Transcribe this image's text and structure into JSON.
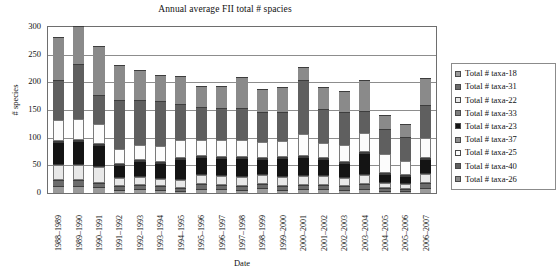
{
  "chart_data": {
    "type": "bar",
    "stacked": true,
    "title": "Annual average FII total # spacies",
    "xlabel": "Date",
    "ylabel": "# species",
    "ylim": [
      0,
      300
    ],
    "yticks": [
      0,
      50,
      100,
      150,
      200,
      250,
      300
    ],
    "grid": true,
    "legend_position": "right",
    "categories": [
      "1988–1989",
      "1989–1990",
      "1990–1991",
      "1991–1992",
      "1992–1993",
      "1993–1994",
      "1994–1995",
      "1995–1996",
      "1996–1997",
      "1997–1998",
      "1998–1999",
      "1999–2000",
      "2000–2001",
      "2001–2002",
      "2002–2003",
      "2003–2004",
      "2004–2005",
      "2005–2006",
      "2006–2007"
    ],
    "series": [
      {
        "name": "Total # taxa-18",
        "color": "#9a9a9a",
        "values": [
          12,
          12,
          10,
          6,
          7,
          6,
          4,
          8,
          7,
          6,
          9,
          6,
          7,
          7,
          6,
          8,
          4,
          4,
          9
        ]
      },
      {
        "name": "Total # taxa-31",
        "color": "#6b6b6b",
        "values": [
          11,
          11,
          8,
          6,
          7,
          6,
          5,
          8,
          7,
          6,
          8,
          7,
          8,
          7,
          7,
          9,
          5,
          4,
          9
        ]
      },
      {
        "name": "Total # taxa-22",
        "color": "#e8e8e8",
        "values": [
          28,
          28,
          29,
          15,
          15,
          14,
          15,
          16,
          16,
          17,
          15,
          16,
          16,
          16,
          15,
          16,
          9,
          8,
          17
        ]
      },
      {
        "name": "Total # taxa-33",
        "color": "#7d7d7d",
        "values": [
          1,
          1,
          1,
          1,
          1,
          1,
          1,
          1,
          1,
          1,
          1,
          1,
          1,
          1,
          1,
          1,
          1,
          1,
          1
        ]
      },
      {
        "name": "Total # taxa-23",
        "color": "#141414",
        "values": [
          40,
          42,
          38,
          22,
          28,
          27,
          36,
          32,
          32,
          33,
          28,
          32,
          33,
          30,
          25,
          37,
          14,
          13,
          25
        ]
      },
      {
        "name": "Total # taxa-37",
        "color": "#8f8f8f",
        "values": [
          1,
          1,
          1,
          1,
          1,
          1,
          1,
          1,
          1,
          1,
          1,
          1,
          1,
          1,
          1,
          1,
          1,
          1,
          1
        ]
      },
      {
        "name": "Total # taxa-25",
        "color": "#fcfcfc",
        "values": [
          38,
          37,
          37,
          27,
          27,
          28,
          32,
          29,
          30,
          31,
          29,
          29,
          39,
          27,
          31,
          34,
          35,
          25,
          36
        ]
      },
      {
        "name": "Total # taxa-40",
        "color": "#5f5f5f",
        "values": [
          72,
          99,
          52,
          88,
          81,
          81,
          65,
          59,
          58,
          57,
          54,
          53,
          98,
          62,
          59,
          41,
          46,
          43,
          60
        ]
      },
      {
        "name": "Total # taxa-26",
        "color": "#8a8a8a",
        "values": [
          78,
          69,
          88,
          64,
          53,
          48,
          51,
          38,
          40,
          56,
          41,
          45,
          23,
          39,
          38,
          55,
          25,
          25,
          49
        ]
      }
    ]
  },
  "legend": {
    "items": [
      {
        "label": "Total # taxa-18",
        "color": "#9a9a9a"
      },
      {
        "label": "Total # taxa-31",
        "color": "#6b6b6b"
      },
      {
        "label": "Total # taxa-22",
        "color": "#e8e8e8"
      },
      {
        "label": "Total # taxa-33",
        "color": "#7d7d7d"
      },
      {
        "label": "Total # taxa-23",
        "color": "#141414"
      },
      {
        "label": "Total # taxa-37",
        "color": "#8f8f8f"
      },
      {
        "label": "Total # taxa-25",
        "color": "#fcfcfc"
      },
      {
        "label": "Total # taxa-40",
        "color": "#5f5f5f"
      },
      {
        "label": "Total # taxa-26",
        "color": "#8a8a8a"
      }
    ]
  }
}
